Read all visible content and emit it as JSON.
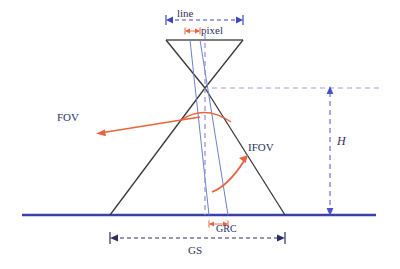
{
  "figure": {
    "type": "technical-diagram",
    "colors": {
      "ground_line": "#3b3fa8",
      "dimension_blue": "#4a52c8",
      "cone_black": "#3a3a3a",
      "ifov_blue": "#6f7fd0",
      "accent_orange": "#e8643c",
      "text": "#2f2f5f",
      "background": "#ffffff"
    },
    "labels": {
      "line": "line",
      "pixel": "pixel",
      "fov": "FOV",
      "ifov": "IFOV",
      "height": "H",
      "gs": "GS",
      "grc": "GRC"
    }
  },
  "geometry": {
    "apex": {
      "x": 205,
      "y": 88
    },
    "ground_y": 215,
    "ground_x_start": 22,
    "ground_x_end": 376,
    "detector_bar": {
      "y": 40,
      "x_left": 166,
      "x_right": 243
    },
    "swath": {
      "x_left": 110,
      "x_right": 285
    },
    "grc": {
      "x_left": 209,
      "x_right": 228
    },
    "pixel_marks": {
      "x_left": 185,
      "x_right": 200,
      "y": 31
    },
    "line_dimension": {
      "y": 20,
      "x_left": 166,
      "x_right": 243
    },
    "gs_dimension": {
      "y": 238,
      "x_left": 110,
      "x_right": 285
    },
    "height_dimension": {
      "x": 330,
      "y_top": 88,
      "y_bottom": 215
    }
  }
}
